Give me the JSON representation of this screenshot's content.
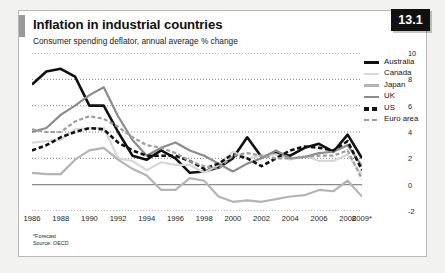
{
  "badge": {
    "label": "13.1"
  },
  "header": {
    "title": "Inflation in industrial countries",
    "subtitle": "Consumer spending deflator, annual average % change"
  },
  "notes": {
    "forecast": "*Forecast",
    "source": "Source: OECD"
  },
  "colors": {
    "australia": "#111111",
    "canada": "#d8d8d8",
    "japan": "#b4b4b4",
    "uk": "#8c8c8c",
    "us": "#111111",
    "euro_area": "#9e9e9e",
    "zero_line": "#8a8a8a",
    "gridline": "#555555",
    "badge_bg": "#111111",
    "accent_bar": "#9a9a9a"
  },
  "chart_data": {
    "type": "line",
    "title": "Inflation in industrial countries",
    "subtitle": "Consumer spending deflator, annual average % change",
    "xlabel": "",
    "ylabel": "",
    "ylim": [
      -2,
      10
    ],
    "xlim": [
      1986,
      2009
    ],
    "yticks": [
      10,
      8,
      6,
      4,
      2,
      0,
      -2
    ],
    "xticks": [
      1986,
      1988,
      1990,
      1992,
      1994,
      1996,
      1998,
      2000,
      2002,
      2004,
      2006,
      2008,
      "2009*"
    ],
    "grid": "horizontal-dotted",
    "zero_line": true,
    "legend_position": "right",
    "x": [
      1986,
      1987,
      1988,
      1989,
      1990,
      1991,
      1992,
      1993,
      1994,
      1995,
      1996,
      1997,
      1998,
      1999,
      2000,
      2001,
      2002,
      2003,
      2004,
      2005,
      2006,
      2007,
      2008,
      2009
    ],
    "series": [
      {
        "name": "Australia",
        "style": "solid",
        "width": 2.6,
        "color": "#111111",
        "values": [
          7.6,
          8.6,
          8.8,
          8.2,
          6.0,
          6.0,
          4.0,
          2.2,
          1.9,
          2.6,
          2.0,
          0.9,
          1.0,
          1.3,
          2.0,
          3.6,
          2.1,
          2.4,
          2.2,
          2.8,
          3.1,
          2.5,
          3.8,
          2.0
        ]
      },
      {
        "name": "Canada",
        "style": "solid",
        "width": 2.2,
        "color": "#d8d8d8",
        "values": [
          3.2,
          3.3,
          3.4,
          4.2,
          4.3,
          4.3,
          2.0,
          1.8,
          1.1,
          1.7,
          1.5,
          1.5,
          0.9,
          1.5,
          2.5,
          2.0,
          2.2,
          2.3,
          1.9,
          2.2,
          1.8,
          1.8,
          2.3,
          0.7
        ]
      },
      {
        "name": "Japan",
        "style": "solid",
        "width": 2.2,
        "color": "#b4b4b4",
        "values": [
          0.9,
          0.8,
          0.8,
          1.9,
          2.6,
          2.8,
          1.9,
          1.2,
          0.7,
          -0.4,
          -0.4,
          0.5,
          0.3,
          -0.9,
          -1.3,
          -1.2,
          -1.3,
          -1.1,
          -0.9,
          -0.8,
          -0.4,
          -0.5,
          0.3,
          -0.9
        ]
      },
      {
        "name": "UK",
        "style": "solid",
        "width": 2.2,
        "color": "#8c8c8c",
        "values": [
          4.0,
          4.3,
          5.3,
          6.0,
          6.8,
          7.4,
          5.2,
          3.4,
          2.2,
          2.8,
          3.2,
          2.6,
          2.2,
          1.6,
          1.0,
          1.6,
          2.0,
          2.6,
          2.0,
          2.1,
          2.4,
          2.5,
          3.0,
          1.4
        ]
      },
      {
        "name": "US",
        "style": "dashed",
        "width": 2.6,
        "color": "#111111",
        "values": [
          2.6,
          3.0,
          3.6,
          4.0,
          4.3,
          4.2,
          3.2,
          2.6,
          2.2,
          2.2,
          2.2,
          1.8,
          1.2,
          1.6,
          2.3,
          2.0,
          1.4,
          2.0,
          2.6,
          2.9,
          2.8,
          2.6,
          3.3,
          1.1
        ]
      },
      {
        "name": "Euro area",
        "style": "dashed",
        "width": 2.2,
        "color": "#9e9e9e",
        "values": [
          4.2,
          4.0,
          4.0,
          4.8,
          5.2,
          5.0,
          4.4,
          3.6,
          3.0,
          2.8,
          2.4,
          1.8,
          1.4,
          1.2,
          2.2,
          2.4,
          2.2,
          2.0,
          2.0,
          2.1,
          2.2,
          2.2,
          2.6,
          0.4
        ]
      }
    ]
  },
  "legend": {
    "items": [
      {
        "label": "Australia",
        "style": "solid",
        "color": "#111111",
        "thickness": 3.4
      },
      {
        "label": "Canada",
        "style": "solid",
        "color": "#d8d8d8",
        "thickness": 2.6
      },
      {
        "label": "Japan",
        "style": "solid",
        "color": "#b4b4b4",
        "thickness": 2.6
      },
      {
        "label": "UK",
        "style": "solid",
        "color": "#8c8c8c",
        "thickness": 2.6
      },
      {
        "label": "US",
        "style": "dashed",
        "color": "#111111",
        "thickness": 3.4
      },
      {
        "label": "Euro area",
        "style": "dashed",
        "color": "#9e9e9e",
        "thickness": 2.4
      }
    ]
  }
}
